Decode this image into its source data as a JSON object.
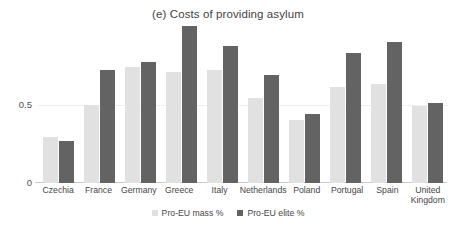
{
  "chart_data": {
    "type": "bar",
    "title": "(e) Costs of providing asylum",
    "xlabel": "",
    "ylabel": "",
    "ylim": [
      0,
      1.0
    ],
    "yticks": [
      "0",
      "0.5"
    ],
    "ytick_values": [
      0,
      0.5
    ],
    "grid": true,
    "grid_axis": "y",
    "legend_position": "bottom-center",
    "categories": [
      "Czechia",
      "France",
      "Germany",
      "Greece",
      "Italy",
      "Netherlands",
      "Poland",
      "Portugal",
      "Spain",
      "United\nKingdom"
    ],
    "series": [
      {
        "name": "Pro-EU mass %",
        "color": "#e1e1e1",
        "values": [
          0.29,
          0.5,
          0.74,
          0.71,
          0.72,
          0.54,
          0.4,
          0.61,
          0.63,
          0.49
        ]
      },
      {
        "name": "Pro-EU elite %",
        "color": "#636363",
        "values": [
          0.27,
          0.72,
          0.77,
          1.0,
          0.87,
          0.69,
          0.44,
          0.83,
          0.9,
          0.51
        ]
      }
    ]
  },
  "colors": {
    "background": "#ffffff",
    "mass_bar": "#e1e1e1",
    "elite_bar": "#636363",
    "axis_line": "#c9c9c9",
    "gridline": "#f0eef2",
    "text": "#464646"
  }
}
